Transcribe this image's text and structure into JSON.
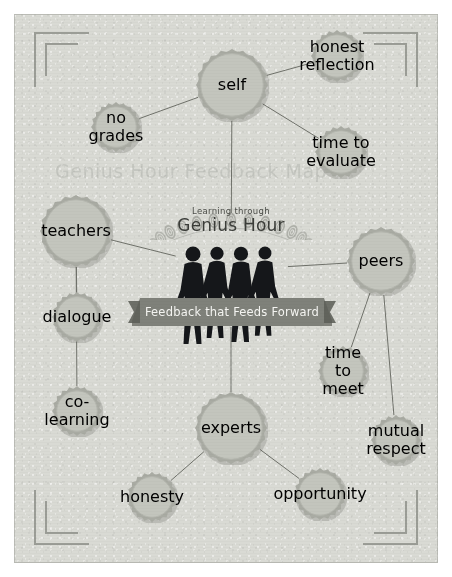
{
  "page": {
    "background_color": "#d9dad4",
    "accent_dark": "#2e3030",
    "accent_mid": "#8d8f88",
    "accent_light": "#c3c5bd",
    "watermark_text": "Genius Hour Feedback Map"
  },
  "logo": {
    "tagline": "Learning through",
    "title": "Genius Hour",
    "decoration": "fingerprint-arc"
  },
  "banner": {
    "text": "Feedback that Feeds Forward",
    "color": "#7f817a"
  },
  "nodes": {
    "primary": [
      {
        "id": "self",
        "label": "self",
        "x": 232,
        "y": 85,
        "r": 37
      },
      {
        "id": "teachers",
        "label": "teachers",
        "x": 76,
        "y": 231,
        "r": 37
      },
      {
        "id": "peers",
        "label": "peers",
        "x": 381,
        "y": 261,
        "r": 35
      },
      {
        "id": "experts",
        "label": "experts",
        "x": 231,
        "y": 428,
        "r": 37
      }
    ],
    "secondary": [
      {
        "id": "honest-reflection",
        "label": "honest reflection",
        "parent": "self",
        "x": 337,
        "y": 56,
        "r": 27
      },
      {
        "id": "no-grades",
        "label": "no grades",
        "parent": "self",
        "x": 116,
        "y": 127,
        "r": 26
      },
      {
        "id": "time-to-evaluate",
        "label": "time to evaluate",
        "parent": "self",
        "x": 341,
        "y": 152,
        "r": 27
      },
      {
        "id": "dialogue",
        "label": "dialogue",
        "parent": "teachers",
        "x": 77,
        "y": 317,
        "r": 26
      },
      {
        "id": "co-learning",
        "label": "co-learning",
        "parent": "teachers",
        "x": 77,
        "y": 411,
        "r": 26
      },
      {
        "id": "time-to-meet",
        "label": "time to meet",
        "parent": "peers",
        "x": 343,
        "y": 371,
        "r": 26
      },
      {
        "id": "mutual-respect",
        "label": "mutual respect",
        "parent": "peers",
        "x": 396,
        "y": 440,
        "r": 26
      },
      {
        "id": "honesty",
        "label": "honesty",
        "parent": "experts",
        "x": 152,
        "y": 497,
        "r": 26
      },
      {
        "id": "opportunity",
        "label": "opportunity",
        "parent": "experts",
        "x": 320,
        "y": 494,
        "r": 27
      }
    ]
  },
  "links": [
    {
      "from": "center",
      "to": "self"
    },
    {
      "from": "center",
      "to": "teachers"
    },
    {
      "from": "center",
      "to": "peers"
    },
    {
      "from": "center",
      "to": "experts"
    },
    {
      "from": "self",
      "to": "honest-reflection"
    },
    {
      "from": "self",
      "to": "no-grades"
    },
    {
      "from": "self",
      "to": "time-to-evaluate"
    },
    {
      "from": "teachers",
      "to": "dialogue"
    },
    {
      "from": "teachers",
      "to": "co-learning"
    },
    {
      "from": "peers",
      "to": "time-to-meet"
    },
    {
      "from": "peers",
      "to": "mutual-respect"
    },
    {
      "from": "experts",
      "to": "honesty"
    },
    {
      "from": "experts",
      "to": "opportunity"
    }
  ],
  "corners": [
    {
      "id": "top-left"
    },
    {
      "id": "top-right"
    },
    {
      "id": "bottom-left"
    },
    {
      "id": "bottom-right"
    }
  ]
}
